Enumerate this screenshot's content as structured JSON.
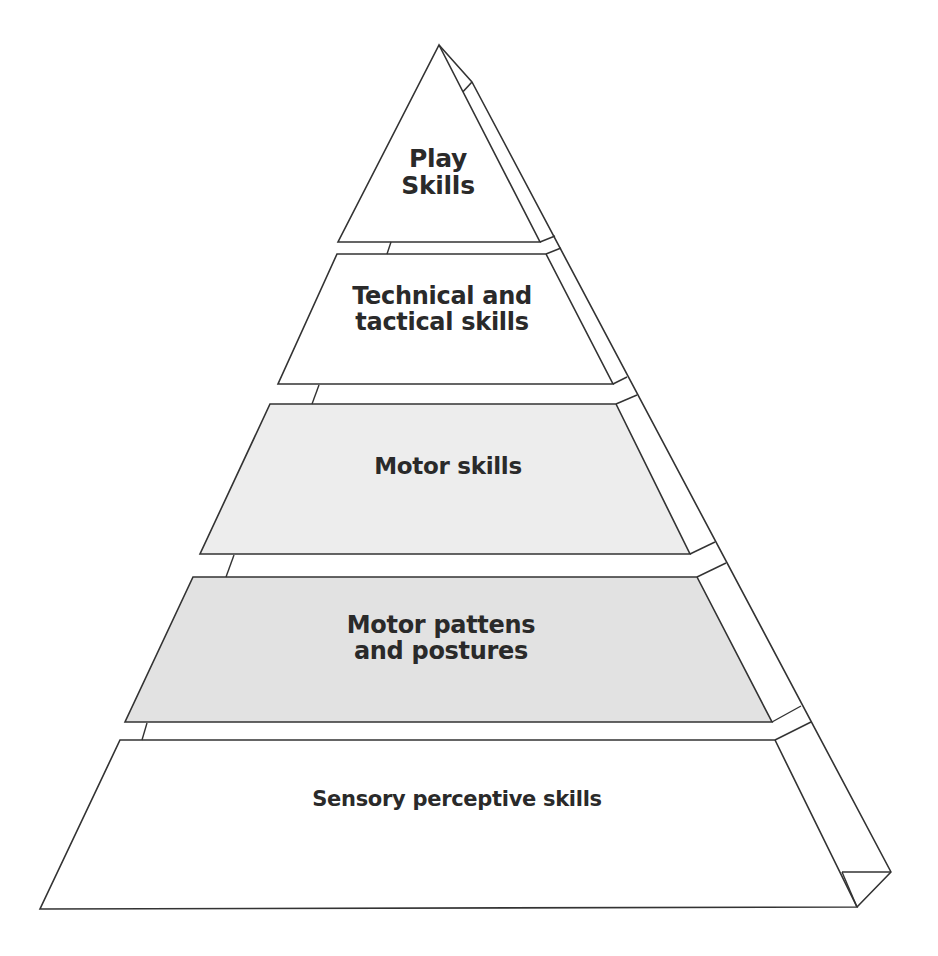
{
  "diagram": {
    "type": "pyramid",
    "colors": {
      "stroke": "#333333",
      "background": "#ffffff",
      "tier_white": "#ffffff",
      "tier_light_grey": "#ededed",
      "tier_mid_grey": "#e2e2e2"
    },
    "tiers": [
      {
        "level": 5,
        "lines": [
          "Play",
          "Skills"
        ],
        "fill": "#ffffff"
      },
      {
        "level": 4,
        "lines": [
          "Technical and",
          "tactical skills"
        ],
        "fill": "#ffffff"
      },
      {
        "level": 3,
        "lines": [
          "Motor skills"
        ],
        "fill": "#ededed"
      },
      {
        "level": 2,
        "lines": [
          "Motor pattens",
          "and postures"
        ],
        "fill": "#e2e2e2"
      },
      {
        "level": 1,
        "lines": [
          "Sensory perceptive skills"
        ],
        "fill": "#ffffff"
      }
    ]
  }
}
